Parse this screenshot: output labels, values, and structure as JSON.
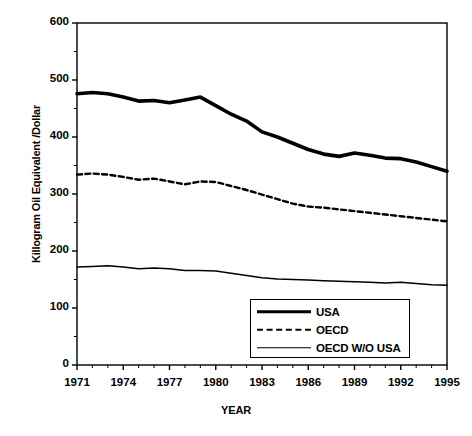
{
  "chart_data": {
    "type": "line",
    "title": "",
    "xlabel": "YEAR",
    "ylabel": "Killogram Oil Equivalent /Dollar",
    "xlim": [
      1971,
      1995
    ],
    "ylim": [
      0,
      600
    ],
    "ytick_values": [
      0,
      100,
      200,
      300,
      400,
      500,
      600
    ],
    "ytick_labels": [
      "0",
      "100",
      "200",
      "300",
      "400",
      "500",
      "600"
    ],
    "xtick_values": [
      1971,
      1974,
      1977,
      1980,
      1983,
      1986,
      1989,
      1992,
      1995
    ],
    "xtick_labels": [
      "1971",
      "1974",
      "1977",
      "1980",
      "1983",
      "1986",
      "1989",
      "1992",
      "1995"
    ],
    "grid": false,
    "legend_position": "lower right",
    "x": [
      1971,
      1972,
      1973,
      1974,
      1975,
      1976,
      1977,
      1978,
      1979,
      1980,
      1981,
      1982,
      1983,
      1984,
      1985,
      1986,
      1987,
      1988,
      1989,
      1990,
      1991,
      1992,
      1993,
      1994,
      1995
    ],
    "series": [
      {
        "name": "USA",
        "style": "solid-thick",
        "color": "#000000",
        "values": [
          476,
          478,
          476,
          470,
          463,
          464,
          460,
          465,
          470,
          455,
          440,
          428,
          409,
          400,
          389,
          378,
          370,
          366,
          372,
          368,
          363,
          362,
          356,
          348,
          340
        ]
      },
      {
        "name": "OECD",
        "style": "dashed",
        "color": "#000000",
        "values": [
          334,
          336,
          334,
          330,
          325,
          327,
          322,
          317,
          322,
          321,
          314,
          307,
          299,
          291,
          283,
          278,
          276,
          273,
          270,
          267,
          264,
          261,
          258,
          255,
          252
        ]
      },
      {
        "name": "OECD W/O USA",
        "style": "solid-thin",
        "color": "#000000",
        "values": [
          172,
          173,
          174,
          172,
          169,
          170,
          169,
          166,
          166,
          165,
          161,
          157,
          153,
          151,
          150,
          149,
          148,
          147,
          146,
          145,
          144,
          145,
          143,
          141,
          140
        ]
      }
    ]
  },
  "legend": {
    "items": [
      {
        "label": "USA"
      },
      {
        "label": "OECD"
      },
      {
        "label": "OECD W/O USA"
      }
    ]
  }
}
